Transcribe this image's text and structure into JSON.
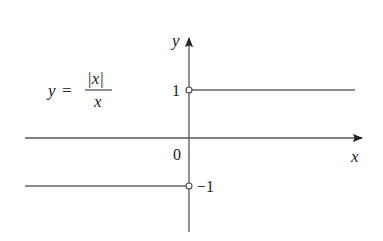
{
  "figure": {
    "equation": {
      "lhs": "y",
      "equals": "=",
      "numerator": "|x|",
      "denominator": "x"
    },
    "axes": {
      "x_label": "x",
      "y_label": "y",
      "origin_label": "0"
    },
    "tick_labels": {
      "positive_one": "1",
      "negative_one": "−1"
    },
    "colors": {
      "axis": "#555555",
      "curve": "#666666",
      "text": "#222222"
    }
  }
}
